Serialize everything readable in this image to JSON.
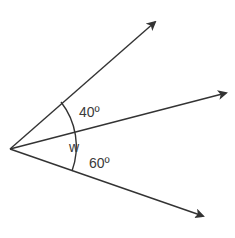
{
  "diagram": {
    "type": "angles-at-a-point",
    "vertex": {
      "x": 10,
      "y": 149
    },
    "rays": [
      {
        "name": "upper",
        "tip": {
          "x": 156,
          "y": 21
        }
      },
      {
        "name": "middle",
        "tip": {
          "x": 227,
          "y": 93
        }
      },
      {
        "name": "lower",
        "tip": {
          "x": 204,
          "y": 217
        }
      }
    ],
    "arc": {
      "radius": 74
    },
    "labels": {
      "angle_top": "40º",
      "angle_whole": "w",
      "angle_bottom": "60º"
    },
    "colors": {
      "line": "#333333",
      "text": "#3a3a3a",
      "background": "#ffffff"
    }
  }
}
